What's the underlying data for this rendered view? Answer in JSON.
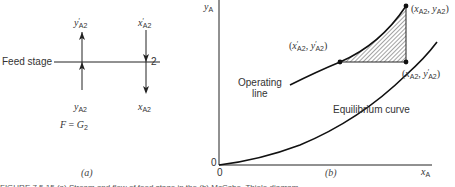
{
  "panel_a": {
    "feed_stage_label": "Feed stage",
    "stage_number": "2",
    "top_left_symbol": "y",
    "top_left_prime": "′",
    "top_left_sub": "A2",
    "top_right_symbol": "x",
    "top_right_prime": "′",
    "top_right_sub": "A2",
    "bottom_left_symbol": "y",
    "bottom_left_sub": "A2",
    "bottom_right_symbol": "x",
    "bottom_right_sub": "A2",
    "equation_lhs": "F",
    "equation_eq": " = ",
    "equation_rhs": "G",
    "equation_rhs_sub": "2",
    "caption": "(a)",
    "icons": [
      "arrow-up-icon",
      "arrow-down-icon"
    ]
  },
  "panel_b": {
    "y_axis_symbol": "y",
    "y_axis_sub": "A",
    "x_axis_symbol": "x",
    "x_axis_sub": "A",
    "origin_x_label": "0",
    "origin_y_label": "0",
    "point_top": {
      "open": "(",
      "x": "x",
      "x_sub": "A2",
      "sep": ", ",
      "y": "y",
      "y_sub": "A2",
      "close": ")"
    },
    "point_left": {
      "open": "(",
      "x": "x",
      "x_prime": "′",
      "x_sub": "A2",
      "sep": ", ",
      "y": "y",
      "y_prime": "′",
      "y_sub": "A2",
      "close": ")"
    },
    "point_bottom": {
      "open": "(",
      "x": "x",
      "x_sub": "A2",
      "sep": ", ",
      "y": "y",
      "y_prime": "′",
      "y_sub": "A2",
      "close": ")"
    },
    "operating_line_label_1": "Operating",
    "operating_line_label_2": "line",
    "equilibrium_label": "Equilibrium curve",
    "caption": "(b)"
  },
  "figure_caption": "FIGURE 7.5.15  (a) Stream  and  flow  of  feed  stage  in  the  (b) McCabe–Thiele diagram..."
}
